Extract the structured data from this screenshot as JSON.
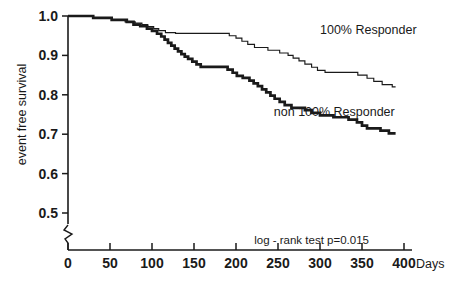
{
  "chart_data": {
    "type": "line",
    "title": "",
    "subtitle": "",
    "xlabel": "Days",
    "ylabel": "event free survival",
    "xlim": [
      0,
      400
    ],
    "ylim": [
      0.5,
      1.0
    ],
    "grid": false,
    "legend_position": "inline-annotation",
    "x_ticks": [
      0,
      50,
      100,
      150,
      200,
      250,
      300,
      350,
      400
    ],
    "x_tick_labels": [
      "0",
      "50",
      "100",
      "150",
      "200",
      "250",
      "300",
      "350",
      "400"
    ],
    "y_ticks": [
      0.5,
      0.6,
      0.7,
      0.8,
      0.9,
      1.0
    ],
    "y_tick_labels": [
      "0.5",
      "0.6",
      "0.7",
      "0.8",
      "0.9",
      "1.0"
    ],
    "y_axis_break": true,
    "annotations": [
      {
        "name": "log-rank-test",
        "text": "log - rank test  p=0.015",
        "x": 255,
        "y": 0.52
      }
    ],
    "series": [
      {
        "name": "100% Responder",
        "label": "100% Responder",
        "style": "thin",
        "label_x": 300,
        "label_y": 0.955,
        "end_value": 0.82,
        "points": [
          [
            0,
            1.0
          ],
          [
            30,
            1.0
          ],
          [
            30,
            0.995
          ],
          [
            52,
            0.995
          ],
          [
            52,
            0.99
          ],
          [
            68,
            0.99
          ],
          [
            68,
            0.985
          ],
          [
            80,
            0.985
          ],
          [
            80,
            0.982
          ],
          [
            88,
            0.982
          ],
          [
            88,
            0.978
          ],
          [
            95,
            0.978
          ],
          [
            95,
            0.973
          ],
          [
            102,
            0.973
          ],
          [
            102,
            0.968
          ],
          [
            108,
            0.968
          ],
          [
            108,
            0.963
          ],
          [
            116,
            0.963
          ],
          [
            116,
            0.958
          ],
          [
            128,
            0.958
          ],
          [
            128,
            0.956
          ],
          [
            192,
            0.956
          ],
          [
            192,
            0.95
          ],
          [
            200,
            0.95
          ],
          [
            200,
            0.944
          ],
          [
            207,
            0.944
          ],
          [
            207,
            0.936
          ],
          [
            214,
            0.936
          ],
          [
            214,
            0.928
          ],
          [
            222,
            0.928
          ],
          [
            222,
            0.92
          ],
          [
            238,
            0.92
          ],
          [
            238,
            0.913
          ],
          [
            252,
            0.913
          ],
          [
            252,
            0.906
          ],
          [
            262,
            0.906
          ],
          [
            262,
            0.9
          ],
          [
            268,
            0.9
          ],
          [
            268,
            0.893
          ],
          [
            275,
            0.893
          ],
          [
            275,
            0.886
          ],
          [
            282,
            0.886
          ],
          [
            282,
            0.878
          ],
          [
            290,
            0.878
          ],
          [
            290,
            0.87
          ],
          [
            297,
            0.87
          ],
          [
            297,
            0.862
          ],
          [
            306,
            0.862
          ],
          [
            306,
            0.857
          ],
          [
            345,
            0.857
          ],
          [
            345,
            0.85
          ],
          [
            356,
            0.85
          ],
          [
            356,
            0.842
          ],
          [
            364,
            0.842
          ],
          [
            364,
            0.834
          ],
          [
            374,
            0.834
          ],
          [
            374,
            0.826
          ],
          [
            386,
            0.826
          ],
          [
            386,
            0.82
          ],
          [
            390,
            0.82
          ]
        ]
      },
      {
        "name": "non 100% Responder",
        "label": "non 100% Responder",
        "style": "thick",
        "label_x": 245,
        "label_y": 0.745,
        "end_value": 0.7,
        "points": [
          [
            0,
            1.0
          ],
          [
            30,
            1.0
          ],
          [
            30,
            0.995
          ],
          [
            52,
            0.995
          ],
          [
            52,
            0.99
          ],
          [
            70,
            0.99
          ],
          [
            70,
            0.985
          ],
          [
            78,
            0.985
          ],
          [
            78,
            0.978
          ],
          [
            86,
            0.978
          ],
          [
            86,
            0.974
          ],
          [
            94,
            0.974
          ],
          [
            94,
            0.968
          ],
          [
            100,
            0.968
          ],
          [
            100,
            0.962
          ],
          [
            106,
            0.962
          ],
          [
            106,
            0.955
          ],
          [
            111,
            0.955
          ],
          [
            111,
            0.948
          ],
          [
            115,
            0.948
          ],
          [
            115,
            0.94
          ],
          [
            119,
            0.94
          ],
          [
            119,
            0.932
          ],
          [
            123,
            0.932
          ],
          [
            123,
            0.925
          ],
          [
            127,
            0.925
          ],
          [
            127,
            0.917
          ],
          [
            131,
            0.917
          ],
          [
            131,
            0.91
          ],
          [
            135,
            0.91
          ],
          [
            135,
            0.903
          ],
          [
            139,
            0.903
          ],
          [
            139,
            0.897
          ],
          [
            143,
            0.897
          ],
          [
            143,
            0.891
          ],
          [
            148,
            0.891
          ],
          [
            148,
            0.884
          ],
          [
            153,
            0.884
          ],
          [
            153,
            0.877
          ],
          [
            158,
            0.877
          ],
          [
            158,
            0.871
          ],
          [
            190,
            0.871
          ],
          [
            190,
            0.864
          ],
          [
            196,
            0.864
          ],
          [
            196,
            0.856
          ],
          [
            201,
            0.856
          ],
          [
            201,
            0.848
          ],
          [
            208,
            0.848
          ],
          [
            208,
            0.843
          ],
          [
            216,
            0.843
          ],
          [
            216,
            0.836
          ],
          [
            221,
            0.836
          ],
          [
            221,
            0.829
          ],
          [
            226,
            0.829
          ],
          [
            226,
            0.822
          ],
          [
            231,
            0.822
          ],
          [
            231,
            0.814
          ],
          [
            236,
            0.814
          ],
          [
            236,
            0.806
          ],
          [
            241,
            0.806
          ],
          [
            241,
            0.798
          ],
          [
            246,
            0.798
          ],
          [
            246,
            0.79
          ],
          [
            252,
            0.79
          ],
          [
            252,
            0.782
          ],
          [
            258,
            0.782
          ],
          [
            258,
            0.774
          ],
          [
            266,
            0.774
          ],
          [
            266,
            0.767
          ],
          [
            282,
            0.767
          ],
          [
            282,
            0.761
          ],
          [
            290,
            0.761
          ],
          [
            290,
            0.754
          ],
          [
            300,
            0.754
          ],
          [
            300,
            0.748
          ],
          [
            316,
            0.748
          ],
          [
            316,
            0.743
          ],
          [
            334,
            0.743
          ],
          [
            334,
            0.737
          ],
          [
            344,
            0.737
          ],
          [
            344,
            0.73
          ],
          [
            350,
            0.73
          ],
          [
            350,
            0.722
          ],
          [
            356,
            0.722
          ],
          [
            356,
            0.715
          ],
          [
            372,
            0.715
          ],
          [
            372,
            0.709
          ],
          [
            382,
            0.709
          ],
          [
            382,
            0.702
          ],
          [
            390,
            0.702
          ]
        ]
      }
    ]
  },
  "colors": {
    "ink": "#1a1a1a",
    "background": "#ffffff"
  }
}
